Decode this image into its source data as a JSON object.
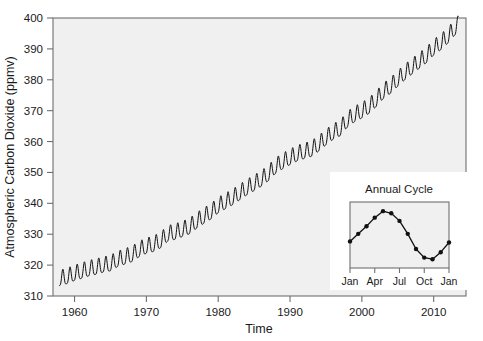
{
  "chart_data": [
    {
      "id": "main",
      "type": "line",
      "title": "",
      "xlabel": "Time",
      "ylabel": "Atmospheric Carbon Dioxide (ppmv)",
      "xlim": [
        1957.0,
        2014.5
      ],
      "ylim": [
        310,
        400
      ],
      "xticks": [
        1960,
        1970,
        1980,
        1990,
        2000,
        2010
      ],
      "xtick_labels": [
        "1960",
        "1970",
        "1980",
        "1990",
        "2000",
        "2010"
      ],
      "yticks": [
        310,
        320,
        330,
        340,
        350,
        360,
        370,
        380,
        390,
        400
      ],
      "ytick_labels": [
        "310",
        "320",
        "330",
        "340",
        "350",
        "360",
        "370",
        "380",
        "390",
        "400"
      ],
      "grid": false,
      "legend": null,
      "plot_background": "#f0f0f0",
      "line_color": "#111111",
      "line_width": 1.0,
      "series": [
        {
          "name": "Mauna Loa monthly mean CO2",
          "description": "Annual mean trend with superimposed seasonal sawtooth of about 6 ppmv peak-to-peak; seasonal maximum in May, minimum in September-October.",
          "seasonal_amplitude_ppmv": 6.0,
          "x": [
            1958.0,
            1959.0,
            1960.0,
            1961.0,
            1962.0,
            1963.0,
            1964.0,
            1965.0,
            1966.0,
            1967.0,
            1968.0,
            1969.0,
            1970.0,
            1971.0,
            1972.0,
            1973.0,
            1974.0,
            1975.0,
            1976.0,
            1977.0,
            1978.0,
            1979.0,
            1980.0,
            1981.0,
            1982.0,
            1983.0,
            1984.0,
            1985.0,
            1986.0,
            1987.0,
            1988.0,
            1989.0,
            1990.0,
            1991.0,
            1992.0,
            1993.0,
            1994.0,
            1995.0,
            1996.0,
            1997.0,
            1998.0,
            1999.0,
            2000.0,
            2001.0,
            2002.0,
            2003.0,
            2004.0,
            2005.0,
            2006.0,
            2007.0,
            2008.0,
            2009.0,
            2010.0,
            2011.0,
            2012.0,
            2013.0
          ],
          "annual_mean": [
            315.3,
            315.9,
            316.9,
            317.6,
            318.4,
            318.9,
            319.6,
            320.0,
            321.4,
            322.2,
            323.0,
            324.6,
            325.7,
            326.3,
            327.5,
            329.7,
            330.2,
            331.1,
            332.0,
            333.8,
            335.4,
            336.8,
            338.8,
            340.1,
            341.4,
            343.0,
            344.6,
            346.0,
            347.4,
            349.2,
            351.6,
            353.1,
            354.4,
            355.6,
            356.4,
            357.1,
            358.8,
            360.8,
            362.6,
            363.8,
            366.6,
            368.3,
            369.5,
            371.0,
            373.2,
            375.8,
            377.5,
            379.8,
            381.9,
            383.8,
            385.6,
            387.4,
            389.9,
            391.6,
            393.8,
            396.5
          ]
        }
      ]
    },
    {
      "id": "inset",
      "type": "line",
      "title": "Annual Cycle",
      "xlabel": "",
      "ylabel": "",
      "grid": false,
      "legend": null,
      "marker": "circle",
      "line_color": "#111111",
      "plot_background": "#f0f0f0",
      "panel_background": "#ffffff",
      "xticks": [
        "Jan",
        "Apr",
        "Jul",
        "Oct",
        "Jan"
      ],
      "xtick_labels": [
        "Jan",
        "Apr",
        "Jul",
        "Oct",
        "Jan"
      ],
      "categories": [
        "Jan",
        "Feb",
        "Mar",
        "Apr",
        "May",
        "Jun",
        "Jul",
        "Aug",
        "Sep",
        "Oct",
        "Nov",
        "Dec",
        "Jan"
      ],
      "values": [
        0.4,
        0.54,
        0.68,
        0.84,
        0.96,
        0.92,
        0.78,
        0.54,
        0.26,
        0.1,
        0.07,
        0.2,
        0.38
      ],
      "ylim": [
        0,
        1
      ],
      "note": "Relative seasonal CO2 deviation: rises from January to a May maximum, falls to a September-October minimum, then rises again."
    }
  ],
  "main_chart": {
    "ylabel": "Atmospheric Carbon Dioxide (ppmv)",
    "xlabel": "Time"
  },
  "inset_chart": {
    "title": "Annual Cycle"
  }
}
